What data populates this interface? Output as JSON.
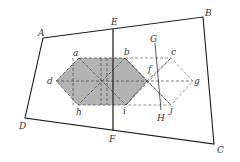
{
  "diagram": {
    "colors": {
      "stroke": "#1a1a1a",
      "dash": "#555555",
      "fill": "#b3b3b3",
      "label": "#333333"
    },
    "quad": {
      "A": [
        43,
        38
      ],
      "B": [
        203,
        17
      ],
      "C": [
        214,
        144
      ],
      "D": [
        25,
        118
      ]
    },
    "line_EF": {
      "E": [
        113,
        29
      ],
      "F": [
        113,
        130
      ]
    },
    "line_GH": {
      "G": [
        155,
        43
      ],
      "H": [
        161,
        110
      ]
    },
    "shaded_hexagon": {
      "a": [
        79,
        58
      ],
      "b": [
        125,
        58
      ],
      "right": [
        147,
        81
      ],
      "i": [
        126,
        105
      ],
      "h": [
        78,
        105
      ],
      "d": [
        56,
        81
      ]
    },
    "outline_hexagon": {
      "b": [
        125,
        58
      ],
      "c": [
        171,
        58
      ],
      "g": [
        193,
        81
      ],
      "j": [
        171,
        105
      ],
      "i": [
        126,
        105
      ],
      "left": [
        147,
        81
      ]
    },
    "labels": [
      {
        "text": "A",
        "x": 38,
        "y": 36
      },
      {
        "text": "B",
        "x": 205,
        "y": 16
      },
      {
        "text": "C",
        "x": 217,
        "y": 153
      },
      {
        "text": "D",
        "x": 19,
        "y": 129
      },
      {
        "text": "E",
        "x": 111,
        "y": 25
      },
      {
        "text": "F",
        "x": 109,
        "y": 142
      },
      {
        "text": "G",
        "x": 150,
        "y": 42
      },
      {
        "text": "H",
        "x": 157,
        "y": 121
      },
      {
        "text": "a",
        "x": 73,
        "y": 56
      },
      {
        "text": "b",
        "x": 124,
        "y": 55
      },
      {
        "text": "c",
        "x": 171,
        "y": 55
      },
      {
        "text": "d",
        "x": 47,
        "y": 84
      },
      {
        "text": "f",
        "x": 148,
        "y": 72
      },
      {
        "text": "g",
        "x": 194,
        "y": 84
      },
      {
        "text": "h",
        "x": 76,
        "y": 115
      },
      {
        "text": "i",
        "x": 123,
        "y": 114
      },
      {
        "text": "j",
        "x": 170,
        "y": 113
      }
    ]
  }
}
